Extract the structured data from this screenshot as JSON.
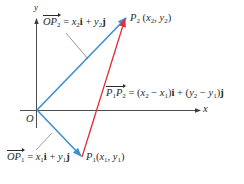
{
  "diagram": {
    "colors": {
      "axis": "#3a3a3a",
      "vector_op": "#3d8fd0",
      "vector_p1p2": "#e02f3a",
      "text": "#2a2a2a",
      "leader": "#555555"
    },
    "axes": {
      "x_label": "x",
      "y_label": "y",
      "origin_label": "O"
    },
    "points": {
      "P1": {
        "name": "P",
        "sub": "1",
        "coords_open": "(",
        "x": "x",
        "x_sub": "1",
        "sep": ", ",
        "y": "y",
        "y_sub": "1",
        "coords_close": ")"
      },
      "P2": {
        "name": "P",
        "sub": "2",
        "coords_open": "(",
        "x": "x",
        "x_sub": "2",
        "sep": ", ",
        "y": "y",
        "y_sub": "2",
        "coords_close": ")"
      }
    },
    "vectors": {
      "OP2": {
        "name_O": "O",
        "name_P": "P",
        "name_sub": "2",
        "eq": " = ",
        "x": "x",
        "x_sub": "2",
        "i": "i",
        "plus": " + ",
        "y": "y",
        "y_sub": "2",
        "j": "j"
      },
      "OP1": {
        "name_O": "O",
        "name_P": "P",
        "name_sub": "1",
        "eq": " = ",
        "x": "x",
        "x_sub": "1",
        "i": "i",
        "plus": " + ",
        "y": "y",
        "y_sub": "1",
        "j": "j"
      },
      "P1P2": {
        "p1": "P",
        "p1_sub": "1",
        "p2": "P",
        "p2_sub": "2",
        "eq": " = (",
        "x2": "x",
        "x2_sub": "2",
        "minus1": " − ",
        "x1": "x",
        "x1_sub": "1",
        "close1": ")",
        "i": "i",
        "plus": " + (",
        "y2": "y",
        "y2_sub": "2",
        "minus2": " − ",
        "y1": "y",
        "y1_sub": "1",
        "close2": ")",
        "j": "j"
      }
    }
  }
}
